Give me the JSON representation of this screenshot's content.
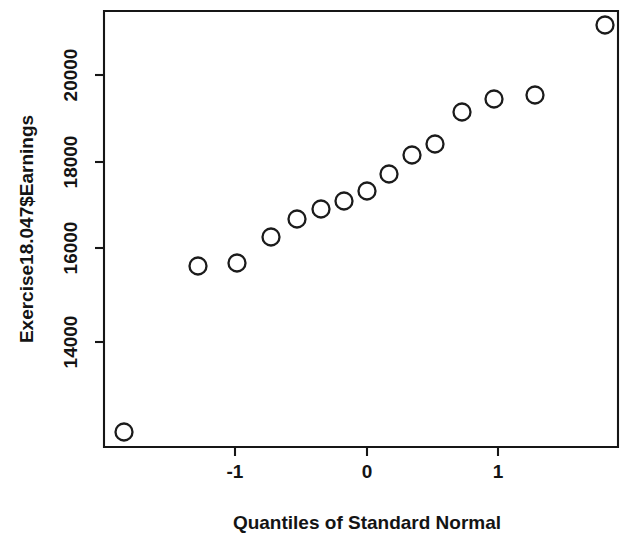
{
  "figure": {
    "background_color": "#ffffff",
    "foreground_color": "#161616",
    "marker": "open-circle"
  },
  "axes": {
    "y_title": "Exercise18.047$Earnings",
    "x_title": "Quantiles of Standard Normal",
    "y_ticks": [
      "14000",
      "16000",
      "18000",
      "20000"
    ],
    "x_ticks": [
      "-1",
      "0",
      "1"
    ]
  },
  "chart_data": {
    "type": "scatter",
    "title": "",
    "subtitle": "",
    "xlabel": "Quantiles of Standard Normal",
    "ylabel": "Exercise18.047$Earnings",
    "xlim": [
      -2.0,
      2.0
    ],
    "ylim": [
      12500,
      21300
    ],
    "grid": false,
    "legend": null,
    "x_ticks": [
      -1,
      0,
      1
    ],
    "x_tick_labels": [
      "-1",
      "0",
      "1"
    ],
    "y_ticks": [
      14000,
      16000,
      18000,
      20000
    ],
    "y_tick_labels": [
      "14000",
      "16000",
      "18000",
      "20000"
    ],
    "series": [
      {
        "name": "Earnings quantiles",
        "marker": "open-circle",
        "color": "#1b1b1b",
        "x": [
          -1.85,
          -1.29,
          -0.99,
          -0.73,
          -0.53,
          -0.35,
          -0.18,
          0.0,
          0.17,
          0.35,
          0.52,
          0.73,
          0.97,
          1.28,
          1.82
        ],
        "y": [
          12560,
          15980,
          16050,
          16500,
          16800,
          17050,
          17230,
          17420,
          17770,
          18150,
          18380,
          19070,
          19340,
          19420,
          20980
        ],
        "points": [
          {
            "x": -1.85,
            "y": 12560
          },
          {
            "x": -1.29,
            "y": 15980
          },
          {
            "x": -0.99,
            "y": 16050
          },
          {
            "x": -0.73,
            "y": 16500
          },
          {
            "x": -0.53,
            "y": 16800
          },
          {
            "x": -0.35,
            "y": 17050
          },
          {
            "x": -0.18,
            "y": 17230
          },
          {
            "x": 0.0,
            "y": 17420
          },
          {
            "x": 0.17,
            "y": 17770
          },
          {
            "x": 0.35,
            "y": 18150
          },
          {
            "x": 0.52,
            "y": 18380
          },
          {
            "x": 0.73,
            "y": 19070
          },
          {
            "x": 0.97,
            "y": 19340
          },
          {
            "x": 1.28,
            "y": 19420
          },
          {
            "x": 1.82,
            "y": 20980
          }
        ]
      }
    ]
  },
  "geometry": {
    "plot_left": 104,
    "plot_right": 618,
    "plot_top": 11,
    "plot_bottom": 447,
    "y_pixel_map": [
      {
        "value": 14000,
        "py": 342
      },
      {
        "value": 16000,
        "py": 248
      },
      {
        "value": 18000,
        "py": 162
      },
      {
        "value": 20000,
        "py": 75
      }
    ],
    "x_pixel_map": [
      {
        "value": -1,
        "px": 235
      },
      {
        "value": 0,
        "px": 367
      },
      {
        "value": 1,
        "px": 498
      }
    ],
    "marker_radius": 8.5,
    "pixel_points": [
      {
        "px": 124,
        "py": 432
      },
      {
        "px": 198,
        "py": 266
      },
      {
        "px": 237,
        "py": 263
      },
      {
        "px": 271,
        "py": 237
      },
      {
        "px": 297,
        "py": 219
      },
      {
        "px": 321,
        "py": 209
      },
      {
        "px": 344,
        "py": 201
      },
      {
        "px": 367,
        "py": 191
      },
      {
        "px": 389,
        "py": 174
      },
      {
        "px": 412,
        "py": 155
      },
      {
        "px": 435,
        "py": 144
      },
      {
        "px": 462,
        "py": 112
      },
      {
        "px": 494,
        "py": 99
      },
      {
        "px": 535,
        "py": 95
      },
      {
        "px": 605,
        "py": 25
      }
    ],
    "y_tick_label_x": 72,
    "x_tick_label_y": 473,
    "y_title_x": 28,
    "y_title_y": 229,
    "x_title_x": 367,
    "x_title_y": 524
  }
}
